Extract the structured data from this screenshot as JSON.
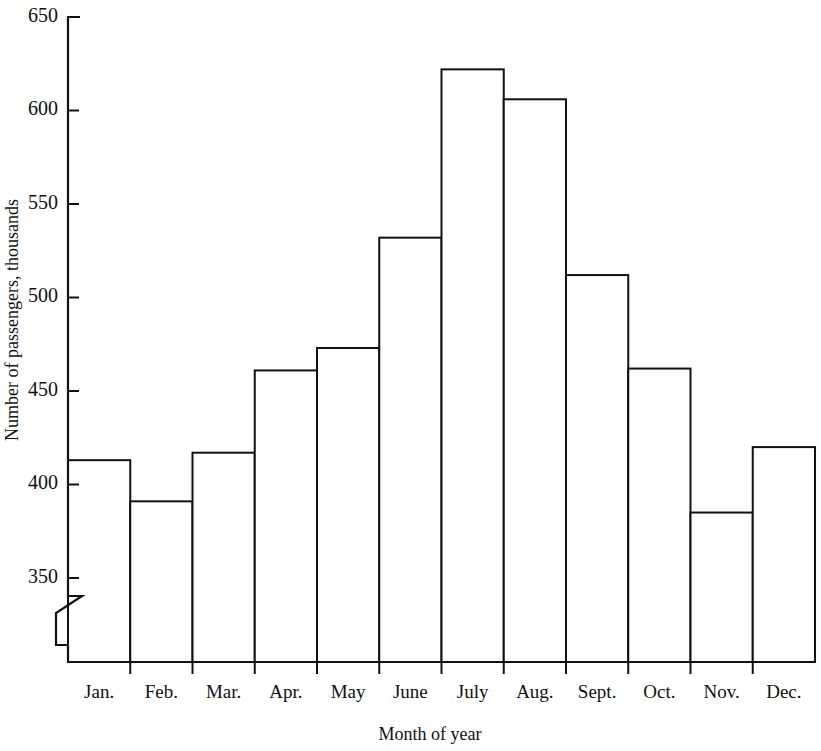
{
  "chart_data": {
    "type": "bar",
    "title": "",
    "subtitle": "",
    "xlabel": "Month of year",
    "ylabel": "Number of passengers, thousands",
    "categories": [
      "Jan.",
      "Feb.",
      "Mar.",
      "Apr.",
      "May",
      "June",
      "July",
      "Aug.",
      "Sept.",
      "Oct.",
      "Nov.",
      "Dec."
    ],
    "values": [
      413,
      391,
      417,
      461,
      473,
      532,
      622,
      606,
      512,
      462,
      385,
      420
    ],
    "series": [
      {
        "name": "Number of passengers",
        "values": [
          413,
          391,
          417,
          461,
          473,
          532,
          622,
          606,
          512,
          462,
          385,
          420
        ]
      }
    ],
    "ylim": [
      330,
      650
    ],
    "y_ticks": [
      350,
      400,
      450,
      500,
      550,
      600,
      650
    ],
    "y_tick_labels": [
      "350",
      "400",
      "450",
      "500",
      "550",
      "600",
      "650"
    ],
    "axis_break": true,
    "axis_break_note": "zigzag break on y-axis below 350",
    "grid": false,
    "legend": false,
    "legend_position": "none",
    "bar_fill_color": "#ffffff",
    "bar_edge_color": "#111111",
    "axis_color": "#111111",
    "background_color": "#ffffff"
  },
  "axis": {
    "y_label": "Number of passengers, thousands",
    "x_label": "Month of year"
  }
}
